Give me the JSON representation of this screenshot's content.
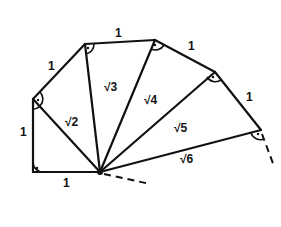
{
  "diagram": {
    "points": {
      "O": [
        100,
        172
      ],
      "P0": [
        33,
        172
      ],
      "P1": [
        33,
        99
      ],
      "P2": [
        85,
        44
      ],
      "P3": [
        155,
        40
      ],
      "P4": [
        215,
        72
      ],
      "P5": [
        261,
        130
      ]
    },
    "outer_edge_labels": [
      "1",
      "1",
      "1",
      "1",
      "1",
      "1"
    ],
    "hypotenuse_labels": [
      "√2",
      "√3",
      "√4",
      "√5",
      "√6"
    ],
    "right_angle_markers": 6,
    "continuation": "dashed lines indicating the spiral continues"
  }
}
